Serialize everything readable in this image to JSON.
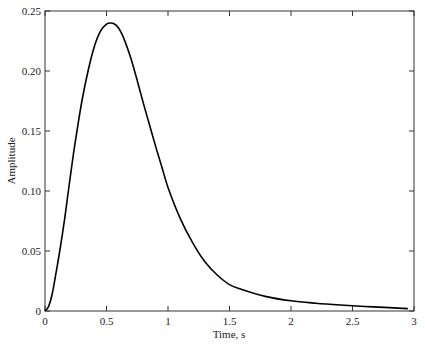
{
  "chart_data": {
    "type": "line",
    "title": "",
    "xlabel": "Time, s",
    "ylabel": "Amplitude",
    "xlim": [
      0,
      3
    ],
    "ylim": [
      0,
      0.25
    ],
    "grid": false,
    "legend": null,
    "x_ticks": [
      "0",
      "0.5",
      "1",
      "1.5",
      "2",
      "2.5",
      "3"
    ],
    "y_ticks": [
      "0",
      "0.05",
      "0.10",
      "0.15",
      "0.20",
      "0.25"
    ],
    "series": [
      {
        "name": "response",
        "color": "#000000",
        "x": [
          0,
          0.03,
          0.06,
          0.09,
          0.12,
          0.16,
          0.19,
          0.23,
          0.26,
          0.3,
          0.35,
          0.4,
          0.45,
          0.5,
          0.54,
          0.58,
          0.62,
          0.66,
          0.7,
          0.75,
          0.8,
          0.85,
          0.9,
          0.95,
          1.0,
          1.1,
          1.2,
          1.3,
          1.4,
          1.5,
          1.6,
          1.8,
          2.0,
          2.2,
          2.4,
          2.6,
          2.8,
          2.95
        ],
        "values": [
          0,
          0.004,
          0.015,
          0.032,
          0.05,
          0.077,
          0.1,
          0.13,
          0.15,
          0.175,
          0.2,
          0.22,
          0.233,
          0.239,
          0.24,
          0.238,
          0.232,
          0.222,
          0.21,
          0.192,
          0.173,
          0.155,
          0.137,
          0.12,
          0.103,
          0.077,
          0.057,
          0.041,
          0.03,
          0.022,
          0.018,
          0.012,
          0.0085,
          0.0065,
          0.005,
          0.0038,
          0.0028,
          0.002
        ]
      }
    ]
  }
}
